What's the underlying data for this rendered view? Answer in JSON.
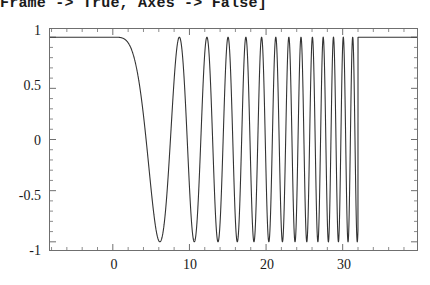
{
  "code": {
    "line": "Frame -> True, Axes -> False]"
  },
  "chart_data": {
    "type": "line",
    "title": "",
    "xlabel": "",
    "ylabel": "",
    "xlim": [
      -8.2,
      39.7
    ],
    "ylim": [
      -1.08,
      1.08
    ],
    "grid": false,
    "legend": null,
    "frame": true,
    "axes": false,
    "line_color": "#333333",
    "xticks_major": [
      0,
      10,
      20,
      30
    ],
    "xtick_labels": [
      "0",
      "10",
      "20",
      "30"
    ],
    "xticks_minor_step": 2,
    "yticks_major": [
      1,
      0.5,
      0,
      -0.5,
      -1
    ],
    "ytick_labels": [
      "1",
      "0.5",
      "0",
      "-0.5",
      "-1"
    ],
    "yticks_minor_step": 0.1,
    "series": [
      {
        "name": "chirp",
        "flat_value": 1,
        "window_start": 0,
        "window_end": 32,
        "formula": "Cos[t^2/12]",
        "x": [
          -8.2,
          -6,
          -4,
          -2,
          0,
          0.5,
          1,
          1.5,
          2,
          2.5,
          3,
          3.5,
          4,
          4.5,
          5,
          5.5,
          6,
          6.5,
          7,
          7.5,
          8,
          8.5,
          9,
          9.5,
          10,
          10.5,
          11,
          11.5,
          12,
          12.5,
          13,
          13.5,
          14,
          14.5,
          15,
          15.5,
          16,
          16.5,
          17,
          17.5,
          18,
          18.5,
          19,
          19.5,
          20,
          20.5,
          21,
          21.5,
          22,
          22.5,
          23,
          23.5,
          24,
          24.5,
          25,
          25.5,
          26,
          26.5,
          27,
          27.5,
          28,
          28.5,
          29,
          29.5,
          30,
          30.5,
          31,
          31.5,
          32,
          34,
          36,
          39.7
        ],
        "y": [
          1,
          1,
          1,
          1,
          1,
          0.99,
          0.97,
          0.93,
          0.87,
          0.79,
          0.69,
          0.57,
          0.44,
          0.29,
          0.14,
          -0.02,
          -0.18,
          -0.34,
          -0.49,
          -0.63,
          -0.76,
          -0.86,
          -0.94,
          -0.99,
          -1.0,
          -0.98,
          -0.92,
          -0.83,
          -0.7,
          -0.53,
          -0.34,
          -0.13,
          0.09,
          0.32,
          0.53,
          0.72,
          0.87,
          0.97,
          1.0,
          0.97,
          0.87,
          0.7,
          0.47,
          0.2,
          -0.1,
          -0.4,
          -0.67,
          -0.88,
          -0.99,
          -0.99,
          -0.88,
          -0.66,
          -0.35,
          0.02,
          0.39,
          0.72,
          0.94,
          1.0,
          0.89,
          0.61,
          0.21,
          -0.24,
          -0.65,
          -0.93,
          -1.0,
          -0.83,
          -0.45,
          0.05,
          1,
          1,
          1,
          1
        ]
      }
    ]
  }
}
